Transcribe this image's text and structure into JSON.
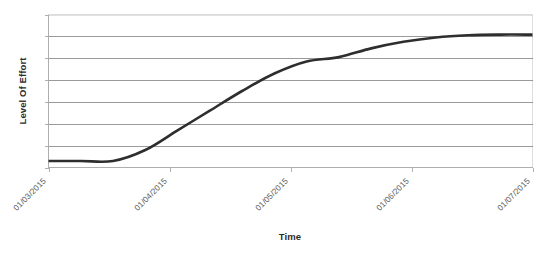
{
  "chart_data": {
    "type": "line",
    "title": "",
    "xlabel": "Time",
    "ylabel": "Level Of Effort",
    "grid": true,
    "legend": false,
    "legend_position": "none",
    "y_tick_labels": [],
    "y_gridline_count": 7,
    "ylim": [
      0,
      7
    ],
    "xlim": [
      "01/03/2015",
      "01/07/2015"
    ],
    "x_tick_labels": [
      "01/03/2015",
      "01/04/2015",
      "01/05/2015",
      "01/06/2015",
      "01/07/2015"
    ],
    "x_tick_rotation_degrees": 45,
    "series": [
      {
        "name": "Level Of Effort",
        "color": "#2e2e2e",
        "x": [
          "01/03/2015",
          "08/03/2015",
          "15/03/2015",
          "22/03/2015",
          "29/03/2015",
          "05/04/2015",
          "12/04/2015",
          "19/04/2015",
          "26/04/2015",
          "01/05/2015",
          "10/05/2015",
          "20/05/2015",
          "01/06/2015",
          "10/06/2015",
          "20/06/2015",
          "01/07/2015"
        ],
        "values": [
          0.3,
          0.3,
          0.3,
          0.8,
          1.7,
          2.6,
          3.5,
          4.3,
          4.85,
          5.05,
          5.45,
          5.75,
          5.95,
          6.05,
          6.08,
          6.08
        ]
      }
    ],
    "annotations": []
  },
  "accessibility": {
    "description": "S-curve showing cumulative level of effort over time from March to July 2015"
  },
  "colors": {
    "series_line": "#2e2e2e",
    "gridline": "#6f6f6f",
    "plot_border": "#d4d4d4",
    "axis": "#a8a8a8",
    "tick_label": "#59595b",
    "axis_title": "#2b2b2b",
    "background": "#ffffff"
  }
}
